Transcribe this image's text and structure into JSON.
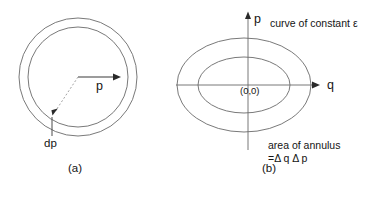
{
  "figure": {
    "panels": [
      {
        "id": "panel-a",
        "caption": "(a)",
        "labels": {
          "radius": "p",
          "thickness": "dp"
        },
        "geometry": {
          "center_x": 78,
          "center_y": 77,
          "outer_radius": 59,
          "inner_radius": 50,
          "radius_arrow_from_x": 78,
          "radius_arrow_to_x": 118,
          "radius_arrow_y": 77,
          "thickness_arrow_from_x": 78,
          "thickness_arrow_from_y": 77,
          "thickness_arrow_to_x": 53,
          "thickness_arrow_to_y": 114,
          "leader_x": 52,
          "leader_from_y": 117,
          "leader_to_y": 136
        }
      },
      {
        "id": "panel-b",
        "caption": "(b)",
        "labels": {
          "vertical_axis": "p",
          "horizontal_axis": "q",
          "origin": "(0,0)",
          "note_curve": "curve of constant ε",
          "note_area_line1": "area of annulus",
          "note_area_line2": "=Δ q Δ p"
        },
        "geometry": {
          "center_x": 244,
          "center_y": 85,
          "outer_rx": 67,
          "outer_ry": 47,
          "inner_rx": 46,
          "inner_ry": 28,
          "p_axis_x": 248,
          "p_axis_top_y": 14,
          "p_axis_bottom_y": 150,
          "q_axis_y": 85,
          "q_axis_left_x": 176,
          "q_axis_right_x": 318
        }
      }
    ],
    "colors": {
      "background": "#ffffff",
      "curve": "#6a6a6a",
      "axis": "#6a6a6a",
      "arrow": "#2a2a2a",
      "dashed": "#9a9a9a",
      "text": "#141414"
    }
  }
}
